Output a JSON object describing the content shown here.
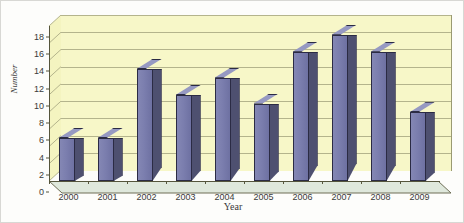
{
  "chart_data": {
    "type": "bar",
    "title": "",
    "xlabel": "Year",
    "ylabel": "Number",
    "categories": [
      "2000",
      "2001",
      "2002",
      "2003",
      "2004",
      "2005",
      "2006",
      "2007",
      "2008",
      "2009"
    ],
    "values": [
      5,
      5,
      13,
      10,
      12,
      9,
      15,
      17,
      15,
      8
    ],
    "ylim": [
      0,
      18
    ],
    "ytick_labels": [
      "0",
      "2",
      "4",
      "6",
      "8",
      "10",
      "12",
      "14",
      "16",
      "18"
    ],
    "ytick_values": [
      0,
      2,
      4,
      6,
      8,
      10,
      12,
      14,
      16,
      18
    ],
    "grid": true,
    "legend": null,
    "three_d": true,
    "style": {
      "plot_background": "#f7f7c8",
      "floor_color": "#dfe8dc",
      "gridline_color": "#b4b48c",
      "bar_face_color": "#7b7eae",
      "bar_side_color": "#4e5070",
      "bar_top_color": "#9699c2",
      "bar_outline_color": "#2b2b44",
      "axis_color": "#55553c",
      "text_color": "#3a3a3a",
      "figure_background": "#fdfdfb",
      "figure_border": "#d8d8d4"
    }
  }
}
